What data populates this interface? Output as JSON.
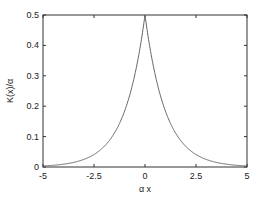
{
  "chart_data": {
    "type": "line",
    "title": "",
    "xlabel": "α x",
    "ylabel": "K(x)/α",
    "xlim": [
      -5,
      5
    ],
    "ylim": [
      0,
      0.5
    ],
    "xticks": [
      -5,
      -2.5,
      0,
      2.5,
      5
    ],
    "xtick_labels": [
      "-5",
      "-2.5",
      "0",
      "2.5",
      "5"
    ],
    "yticks": [
      0,
      0.1,
      0.2,
      0.3,
      0.4,
      0.5
    ],
    "ytick_labels": [
      "0",
      "0.1",
      "0.2",
      "0.3",
      "0.4",
      "0.5"
    ],
    "grid": false,
    "legend": null,
    "series": [
      {
        "name": "K(x)/α = 0.5·exp(-|αx|)",
        "x": [
          -5,
          -4,
          -3,
          -2.5,
          -2,
          -1.5,
          -1,
          -0.5,
          0,
          0.5,
          1,
          1.5,
          2,
          2.5,
          3,
          4,
          5
        ],
        "values": [
          0.0034,
          0.0092,
          0.0249,
          0.041,
          0.0677,
          0.1116,
          0.1839,
          0.3033,
          0.5,
          0.3033,
          0.1839,
          0.1116,
          0.0677,
          0.041,
          0.0249,
          0.0092,
          0.0034
        ]
      }
    ],
    "colors": {
      "line": "#666666",
      "axes": "#333333"
    }
  }
}
